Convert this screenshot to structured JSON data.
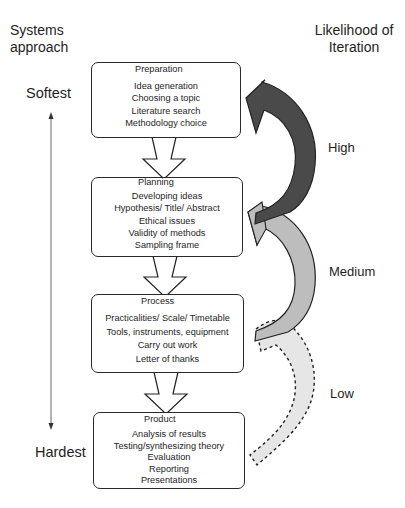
{
  "diagram": {
    "left_header": "Systems approach",
    "left_header_lines": [
      "Systems",
      "approach"
    ],
    "right_header_lines": [
      "Likelihood of",
      "Iteration"
    ],
    "scale": {
      "top_label": "Softest",
      "bottom_label": "Hardest"
    },
    "stages": [
      {
        "title": "Preparation",
        "items": [
          "Idea generation",
          "Choosing a topic",
          "Literature search",
          "Methodology choice"
        ]
      },
      {
        "title": "Planning",
        "items": [
          "Developing ideas",
          "Hypothesis/ Title/ Abstract",
          "Ethical issues",
          "Validity of methods",
          "Sampling frame"
        ]
      },
      {
        "title": "Process",
        "items": [
          "Practicalities/ Scale/ Timetable",
          "Tools, instruments, equipment",
          "Carry out work",
          "Letter of thanks"
        ]
      },
      {
        "title": "Product",
        "items": [
          "Analysis of results",
          "Testing/synthesizing theory",
          "Evaluation",
          "Reporting",
          "Presentations"
        ]
      }
    ],
    "iteration_arrows": [
      {
        "label": "High",
        "from": "Planning",
        "to": "Preparation",
        "fill": "#4a4a4a",
        "stroke": "solid"
      },
      {
        "label": "Medium",
        "from": "Process",
        "to": "Planning",
        "fill": "#bdbdbd",
        "stroke": "solid"
      },
      {
        "label": "Low",
        "from": "Product",
        "to": "Process",
        "fill": "#e6e6e6",
        "stroke": "dashed"
      }
    ],
    "colors": {
      "high": "#4a4a4a",
      "medium": "#bdbdbd",
      "low": "#e6e6e6",
      "outline": "#222222"
    }
  }
}
